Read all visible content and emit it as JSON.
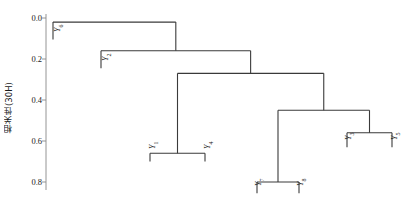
{
  "chart_data": {
    "type": "dendrogram",
    "title": "",
    "xlabel": "",
    "ylabel": "相关性(30H)",
    "ylim": [
      0.0,
      0.9
    ],
    "y_ticks": [
      "0.0",
      "0.2",
      "0.4",
      "0.6",
      "0.8"
    ],
    "y_tick_values": [
      0.0,
      0.2,
      0.4,
      0.6,
      0.8
    ],
    "grid": false,
    "legend": "none",
    "axis_inverted": true,
    "leaves": [
      "Y6",
      "Y2",
      "Y1",
      "Y4",
      "Y7",
      "Y8",
      "Y3",
      "Y5"
    ],
    "leaf_labels": [
      {
        "name": "Y6",
        "base": "Y",
        "sub": "6"
      },
      {
        "name": "Y2",
        "base": "Y",
        "sub": "2"
      },
      {
        "name": "Y1",
        "base": "Y",
        "sub": "1"
      },
      {
        "name": "Y4",
        "base": "Y",
        "sub": "4"
      },
      {
        "name": "Y7",
        "base": "Y",
        "sub": "7"
      },
      {
        "name": "Y8",
        "base": "Y",
        "sub": "8"
      },
      {
        "name": "Y3",
        "base": "Y",
        "sub": "3"
      },
      {
        "name": "Y5",
        "base": "Y",
        "sub": "5"
      }
    ],
    "merges": [
      {
        "id": "M1",
        "left": "Y1",
        "right": "Y4",
        "height": 0.66
      },
      {
        "id": "M2",
        "left": "Y7",
        "right": "Y8",
        "height": 0.8
      },
      {
        "id": "M3",
        "left": "Y3",
        "right": "Y5",
        "height": 0.56
      },
      {
        "id": "M4",
        "left": "M2",
        "right": "M3",
        "height": 0.45
      },
      {
        "id": "M5",
        "left": "M1",
        "right": "M4",
        "height": 0.27
      },
      {
        "id": "M6",
        "left": "Y2",
        "right": "M5",
        "height": 0.16
      },
      {
        "id": "M7",
        "left": "Y6",
        "right": "M6",
        "height": 0.02
      }
    ],
    "line_color": "#3a3a3a",
    "axis_color": "#888888",
    "background_color": "#ffffff"
  }
}
